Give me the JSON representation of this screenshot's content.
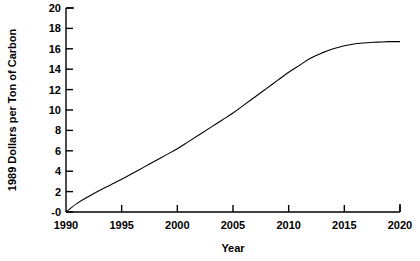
{
  "chart_data": {
    "type": "line",
    "title": "",
    "subtitle": "",
    "xlabel": "Year",
    "ylabel": "1989 Dollars per Ton of Carbon",
    "xlim": [
      1990,
      2020
    ],
    "ylim": [
      0,
      20
    ],
    "xticks": [
      1990,
      1995,
      2000,
      2005,
      2010,
      2015,
      2020
    ],
    "xticklabels": [
      "1990",
      "1995",
      "2000",
      "2005",
      "2010",
      "2015",
      "2020"
    ],
    "yticks": [
      0,
      2,
      4,
      6,
      8,
      10,
      12,
      14,
      16,
      18,
      20
    ],
    "yticklabels": [
      "-0",
      "2",
      "4",
      "6",
      "8",
      "10",
      "12",
      "14",
      "16",
      "18",
      "20"
    ],
    "grid": false,
    "legend": null,
    "line_color": "#000000",
    "axis_color": "#000000",
    "background_color": "#ffffff",
    "series": [
      {
        "name": "Carbon tax",
        "x": [
          1990,
          1991,
          1992,
          1993,
          1994,
          1995,
          1996,
          1997,
          1998,
          1999,
          2000,
          2001,
          2002,
          2003,
          2004,
          2005,
          2006,
          2007,
          2008,
          2009,
          2010,
          2011,
          2012,
          2013,
          2014,
          2015,
          2016,
          2017,
          2018,
          2019,
          2020
        ],
        "y": [
          0.0,
          0.85,
          1.5,
          2.1,
          2.65,
          3.2,
          3.8,
          4.4,
          5.0,
          5.6,
          6.2,
          6.9,
          7.6,
          8.3,
          9.0,
          9.7,
          10.5,
          11.3,
          12.1,
          12.9,
          13.7,
          14.4,
          15.1,
          15.6,
          16.0,
          16.3,
          16.5,
          16.6,
          16.65,
          16.7,
          16.7
        ]
      }
    ]
  },
  "annotations": {
    "y_axis_label": "1989 Dollars per Ton of Carbon",
    "x_axis_label": "Year"
  }
}
